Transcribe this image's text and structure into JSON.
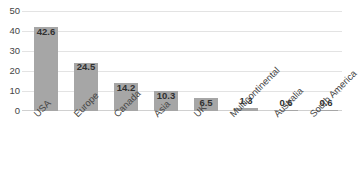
{
  "chart_data": {
    "type": "bar",
    "title": "",
    "xlabel": "",
    "ylabel": "",
    "ylim": [
      0,
      50
    ],
    "yticks": [
      "0",
      "10",
      "20",
      "30",
      "40",
      "50"
    ],
    "grid": "horizontal",
    "legend": "none",
    "bar_color": "#a6a6a6",
    "categories": [
      "USA",
      "Europe",
      "Canada",
      "Asia",
      "UK",
      "Multicontinental",
      "Australia",
      "South America"
    ],
    "values": [
      42.6,
      24.5,
      14.2,
      10.3,
      6.5,
      1.3,
      0.6,
      0.6
    ],
    "value_labels": [
      "42.6",
      "24.5",
      "14.2",
      "10.3",
      "6.5",
      "1.3",
      "0.6",
      "0.6"
    ]
  }
}
